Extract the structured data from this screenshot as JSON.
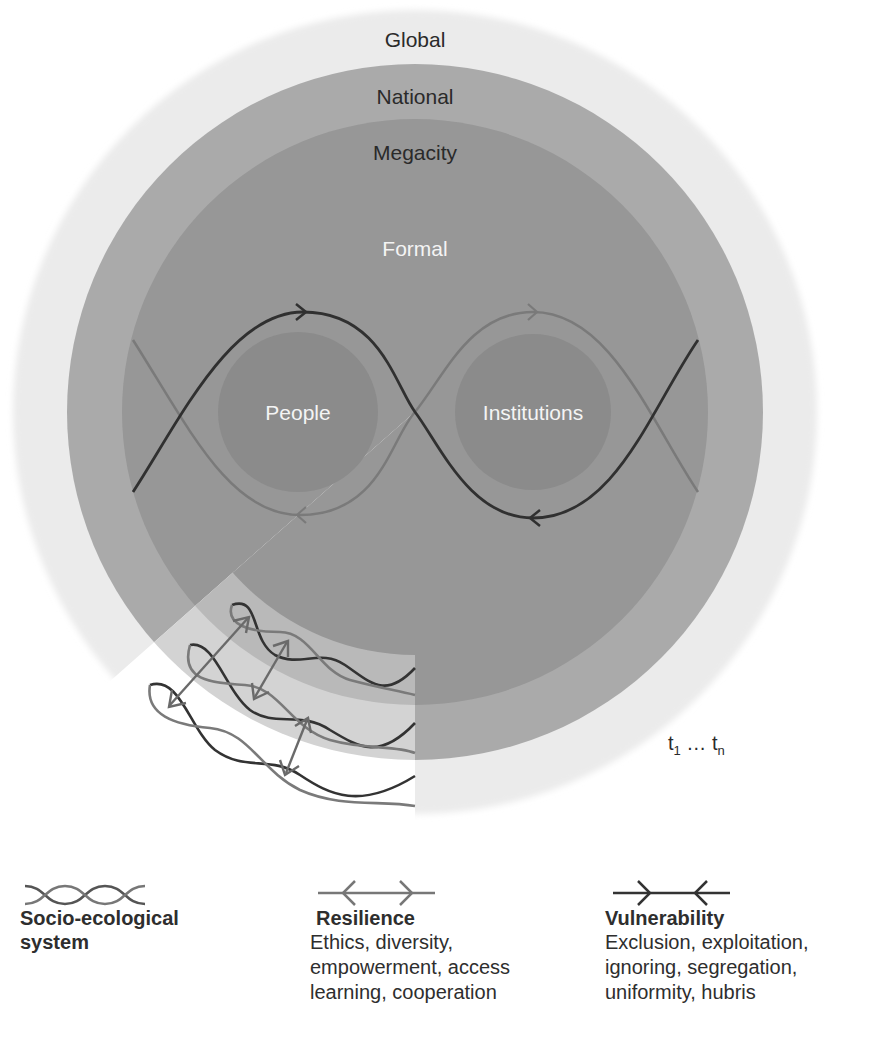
{
  "diagram": {
    "rings": [
      {
        "name": "global",
        "label": "Global",
        "radius": 402,
        "color": "#eaeaea"
      },
      {
        "name": "national",
        "label": "National",
        "radius": 348,
        "color": "#a9a9a9"
      },
      {
        "name": "megacity",
        "label": "Megacity",
        "radius": 293,
        "color": "#959595"
      }
    ],
    "inner_zone_label": "Formal",
    "nodes": [
      {
        "name": "people",
        "label": "People"
      },
      {
        "name": "institutions",
        "label": "Institutions"
      }
    ],
    "time_label": {
      "t": "t",
      "sub1": "1",
      "ellipsis": " … ",
      "subn": "n"
    },
    "colors": {
      "dark_wave": "#333333",
      "light_wave": "#7a7a7a",
      "node_fill": "#8a8a8a",
      "cutaway_inner": "#b8b8b8",
      "cutaway_middle": "#d2d2d2"
    }
  },
  "legend": {
    "socio_ecological": {
      "title_line1": "Socio-ecological",
      "title_line2": "system",
      "icon": "intertwined-waves-icon"
    },
    "resilience": {
      "title": "Resilience",
      "lines": [
        "Ethics, diversity,",
        "empowerment, access",
        "learning, cooperation"
      ],
      "icon": "outward-arrows-icon"
    },
    "vulnerability": {
      "title": "Vulnerability",
      "lines": [
        "Exclusion, exploitation,",
        "ignoring, segregation,",
        "uniformity, hubris"
      ],
      "icon": "inward-arrows-icon"
    }
  }
}
